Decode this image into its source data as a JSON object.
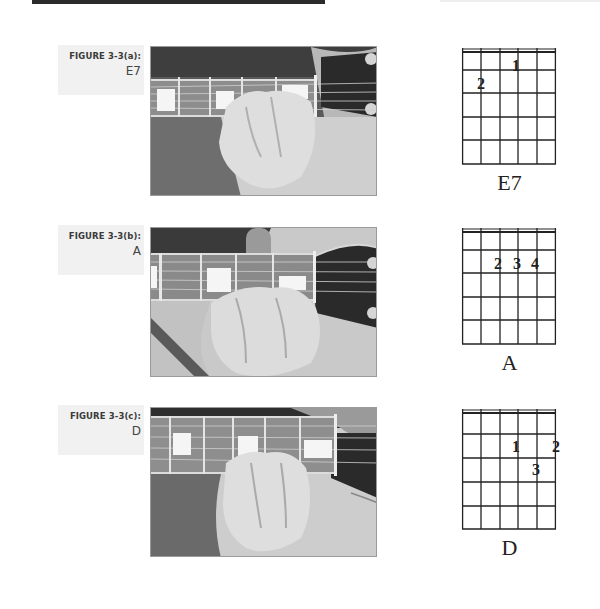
{
  "page": {
    "figures": [
      {
        "figure_label": "FIGURE 3-3(a):",
        "chord_name": "E7",
        "photo_alt": "Hand fretting E7 chord on guitar neck",
        "diagram": {
          "strings": 6,
          "frets": 5,
          "fingerings": [
            {
              "finger": "1",
              "string": 4,
              "fret": 1
            },
            {
              "finger": "2",
              "string": 2,
              "fret": 2
            }
          ]
        }
      },
      {
        "figure_label": "FIGURE 3-3(b):",
        "chord_name": "A",
        "photo_alt": "Hand fretting A chord on guitar neck",
        "diagram": {
          "strings": 6,
          "frets": 5,
          "fingerings": [
            {
              "finger": "2",
              "string": 3,
              "fret": 2
            },
            {
              "finger": "3",
              "string": 4,
              "fret": 2
            },
            {
              "finger": "4",
              "string": 5,
              "fret": 2
            }
          ]
        }
      },
      {
        "figure_label": "FIGURE 3-3(c):",
        "chord_name": "D",
        "photo_alt": "Hand fretting D chord on guitar neck",
        "diagram": {
          "strings": 6,
          "frets": 5,
          "fingerings": [
            {
              "finger": "1",
              "string": 4,
              "fret": 2
            },
            {
              "finger": "2",
              "string": 6,
              "fret": 2
            },
            {
              "finger": "3",
              "string": 5,
              "fret": 3
            }
          ]
        }
      }
    ]
  },
  "colors": {
    "ink": "#222222",
    "label_bg": "#f1f1f1",
    "topbar": "#2b2b2b"
  }
}
